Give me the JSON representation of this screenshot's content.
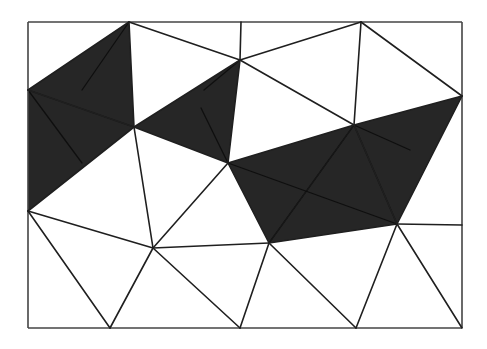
{
  "diagram": {
    "type": "triangulation",
    "frame": {
      "x": 28,
      "y": 22,
      "width": 434,
      "height": 306,
      "stroke": "#444444"
    },
    "colors": {
      "shaded": "#262626",
      "edge": "#1f1f1f",
      "background": "#ffffff"
    },
    "vertices": {
      "A": [
        129,
        22
      ],
      "B": [
        241,
        22
      ],
      "C": [
        361,
        22
      ],
      "D": [
        28,
        90
      ],
      "E": [
        28,
        211
      ],
      "F": [
        462,
        96
      ],
      "G": [
        462,
        225
      ],
      "H": [
        110,
        328
      ],
      "I": [
        240,
        328
      ],
      "J": [
        356,
        328
      ],
      "K": [
        462,
        328
      ],
      "L": [
        134,
        127
      ],
      "M": [
        240,
        60
      ],
      "N": [
        228,
        163
      ],
      "O": [
        354,
        125
      ],
      "P": [
        153,
        248
      ],
      "Q": [
        269,
        243
      ],
      "R": [
        397,
        224
      ],
      "TL": [
        28,
        22
      ],
      "TR": [
        462,
        22
      ],
      "BL": [
        28,
        328
      ],
      "BR": [
        462,
        328
      ]
    },
    "shaded_regions": [
      [
        "D",
        "A",
        "L"
      ],
      [
        "D",
        "L",
        "E"
      ],
      [
        "L",
        "M",
        "N"
      ],
      [
        "N",
        "O",
        "Q"
      ],
      [
        "O",
        "R",
        "Q"
      ],
      [
        "O",
        "F",
        "R"
      ]
    ],
    "edges": [
      [
        "TL",
        "TR"
      ],
      [
        "TR",
        "BR"
      ],
      [
        "BR",
        "BL"
      ],
      [
        "BL",
        "TL"
      ],
      [
        "D",
        "A"
      ],
      [
        "A",
        "L"
      ],
      [
        "D",
        "L"
      ],
      [
        "L",
        "E"
      ],
      [
        "A",
        "M"
      ],
      [
        "B",
        "M"
      ],
      [
        "M",
        "C"
      ],
      [
        "C",
        "F"
      ],
      [
        "M",
        "O"
      ],
      [
        "C",
        "O"
      ],
      [
        "L",
        "M"
      ],
      [
        "M",
        "N"
      ],
      [
        "L",
        "N"
      ],
      [
        "L",
        "P"
      ],
      [
        "N",
        "O"
      ],
      [
        "O",
        "F"
      ],
      [
        "F",
        "R"
      ],
      [
        "R",
        "G"
      ],
      [
        "N",
        "P"
      ],
      [
        "N",
        "Q"
      ],
      [
        "P",
        "Q"
      ],
      [
        "Q",
        "R"
      ],
      [
        "O",
        "R"
      ],
      [
        "E",
        "P"
      ],
      [
        "E",
        "H"
      ],
      [
        "P",
        "H"
      ],
      [
        "P",
        "I"
      ],
      [
        "Q",
        "I"
      ],
      [
        "Q",
        "J"
      ],
      [
        "R",
        "J"
      ],
      [
        "R",
        "K"
      ]
    ],
    "inner_strokes": [
      [
        [
          28,
          90
        ],
        [
          134,
          127
        ]
      ],
      [
        [
          129,
          22
        ],
        [
          82,
          90
        ]
      ],
      [
        [
          28,
          90
        ],
        [
          82,
          163
        ]
      ],
      [
        [
          240,
          60
        ],
        [
          204,
          90
        ]
      ],
      [
        [
          201,
          108
        ],
        [
          228,
          163
        ]
      ],
      [
        [
          354,
          125
        ],
        [
          397,
          224
        ]
      ],
      [
        [
          354,
          125
        ],
        [
          410,
          150
        ]
      ],
      [
        [
          354,
          125
        ],
        [
          269,
          243
        ]
      ],
      [
        [
          228,
          163
        ],
        [
          397,
          224
        ]
      ]
    ]
  }
}
